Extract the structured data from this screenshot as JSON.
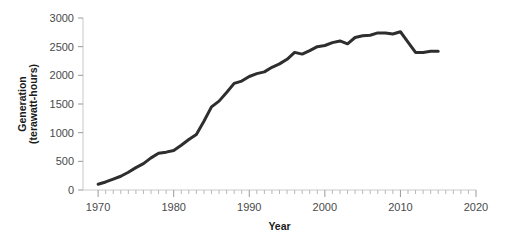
{
  "chart_data": {
    "type": "line",
    "title": "",
    "xlabel": "Year",
    "ylabel": "Generation (terawatt-hours)",
    "ylabel_line1": "Generation",
    "ylabel_line2": "(terawatt-hours)",
    "xlim": [
      1968,
      2020
    ],
    "ylim": [
      0,
      3000
    ],
    "grid": false,
    "legend": "none",
    "x_major_ticks": [
      1970,
      1980,
      1990,
      2000,
      2010,
      2020
    ],
    "x_major_tick_labels": [
      "1970",
      "1980",
      "1990",
      "2000",
      "2010",
      "2020"
    ],
    "x_minor_tick_interval": 1,
    "y_major_ticks": [
      0,
      500,
      1000,
      1500,
      2000,
      2500,
      3000
    ],
    "y_major_tick_labels": [
      "0",
      "500",
      "1000",
      "1500",
      "2000",
      "2500",
      "3000"
    ],
    "line_color": "#2e2e2e",
    "series": [
      {
        "name": "Nuclear electricity generation",
        "x": [
          1970,
          1971,
          1972,
          1973,
          1974,
          1975,
          1976,
          1977,
          1978,
          1979,
          1980,
          1981,
          1982,
          1983,
          1984,
          1985,
          1986,
          1987,
          1988,
          1989,
          1990,
          1991,
          1992,
          1993,
          1994,
          1995,
          1996,
          1997,
          1998,
          1999,
          2000,
          2001,
          2002,
          2003,
          2004,
          2005,
          2006,
          2007,
          2008,
          2009,
          2010,
          2011,
          2012,
          2013,
          2014,
          2015
        ],
        "values": [
          100,
          140,
          190,
          240,
          310,
          390,
          460,
          560,
          640,
          660,
          690,
          780,
          880,
          970,
          1200,
          1450,
          1550,
          1700,
          1860,
          1900,
          1980,
          2030,
          2060,
          2140,
          2200,
          2280,
          2400,
          2370,
          2430,
          2500,
          2520,
          2570,
          2600,
          2550,
          2660,
          2690,
          2700,
          2740,
          2740,
          2720,
          2760,
          2580,
          2400,
          2400,
          2420,
          2420
        ]
      }
    ]
  }
}
